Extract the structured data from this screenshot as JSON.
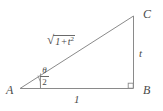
{
  "figure": {
    "type": "right-triangle-geometry-diagram",
    "background_color": "#ffffff",
    "stroke_color": "#7a7a7a",
    "text_color": "#4a4a4a",
    "vertices": {
      "a_label": "A",
      "b_label": "B",
      "c_label": "C"
    },
    "sides": {
      "hypotenuse": {
        "radical_sign": "√",
        "radicand_base": "1",
        "radicand_operator": "+",
        "radicand_term": "t",
        "radicand_exponent": "2",
        "plain_text": "√(1 + t²)"
      },
      "vertical_leg_label": "t",
      "base_label": "1"
    },
    "angle": {
      "numerator": "θ",
      "denominator": "2",
      "plain_text": "θ/2",
      "at_vertex": "A"
    },
    "right_angle_marker": {
      "at_vertex": "B",
      "shown": true
    }
  }
}
